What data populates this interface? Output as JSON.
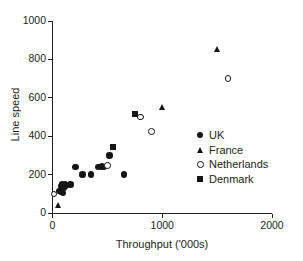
{
  "chart_data": {
    "type": "scatter",
    "title": "",
    "xlabel": "Throughput ('000s)",
    "ylabel": "Line speed",
    "xlim": [
      0,
      2000
    ],
    "ylim": [
      0,
      1000
    ],
    "xticks": [
      0,
      1000,
      2000
    ],
    "yticks": [
      0,
      200,
      400,
      600,
      800,
      1000
    ],
    "xtick_labels": [
      "0",
      "1000",
      "2000"
    ],
    "ytick_labels": [
      "0",
      "200",
      "400",
      "600",
      "800",
      "1000"
    ],
    "grid": false,
    "legend_position": "lower-right-inside",
    "marker_color": "#151515",
    "axis_color": "#231f20",
    "series": [
      {
        "name": "UK",
        "marker": "filled-circle",
        "points": [
          [
            60,
            115
          ],
          [
            75,
            110
          ],
          [
            80,
            140
          ],
          [
            85,
            150
          ],
          [
            95,
            105
          ],
          [
            100,
            130
          ],
          [
            115,
            148
          ],
          [
            120,
            140
          ],
          [
            165,
            148
          ],
          [
            210,
            240
          ],
          [
            275,
            200
          ],
          [
            350,
            200
          ],
          [
            420,
            240
          ],
          [
            450,
            243
          ],
          [
            470,
            240
          ],
          [
            520,
            300
          ],
          [
            650,
            200
          ]
        ]
      },
      {
        "name": "France",
        "marker": "filled-triangle",
        "points": [
          [
            55,
            40
          ],
          [
            1000,
            550
          ],
          [
            1500,
            850
          ]
        ]
      },
      {
        "name": "Netherlands",
        "marker": "open-circle",
        "points": [
          [
            15,
            100
          ],
          [
            500,
            248
          ],
          [
            800,
            500
          ],
          [
            900,
            425
          ],
          [
            1600,
            700
          ]
        ]
      },
      {
        "name": "Denmark",
        "marker": "filled-square",
        "points": [
          [
            550,
            345
          ],
          [
            750,
            515
          ]
        ]
      }
    ]
  },
  "legend": {
    "items": [
      {
        "label": "UK",
        "marker": "filled-circle"
      },
      {
        "label": "France",
        "marker": "filled-triangle"
      },
      {
        "label": "Netherlands",
        "marker": "open-circle"
      },
      {
        "label": "Denmark",
        "marker": "filled-square"
      }
    ]
  }
}
